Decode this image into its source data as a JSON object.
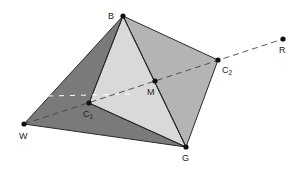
{
  "diagram": {
    "type": "tetrahedron-with-line",
    "colors": {
      "dark_face": "#7a7a7a",
      "medium_face": "#b4b4b4",
      "light_face": "#d9d9d9",
      "edge": "#2a2a2a",
      "dashed_line": "#444444",
      "hidden_dash": "#ffffff",
      "point": "#111111"
    },
    "points": {
      "B": {
        "x": 123,
        "y": 16,
        "label": "B"
      },
      "R": {
        "x": 283,
        "y": 39,
        "label": "R"
      },
      "C2": {
        "x": 218,
        "y": 60,
        "label": "C",
        "sub": "2"
      },
      "M": {
        "x": 155,
        "y": 81,
        "label": "M"
      },
      "C1": {
        "x": 89,
        "y": 103,
        "label": "C",
        "sub": "1"
      },
      "W": {
        "x": 24,
        "y": 124,
        "label": "W"
      },
      "G": {
        "x": 186,
        "y": 147,
        "label": "G"
      }
    },
    "labels": {
      "B": "B",
      "R": "R",
      "C2": "C",
      "C2_sub": "2",
      "M": "M",
      "C1": "C",
      "C1_sub": "1",
      "W": "W",
      "G": "G"
    }
  }
}
